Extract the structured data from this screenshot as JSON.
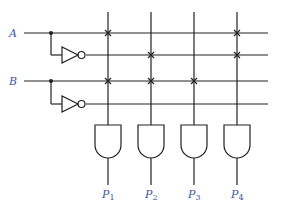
{
  "diagram": {
    "type": "PLA-style AND array",
    "inputs": [
      {
        "name": "A",
        "y": 33,
        "inv_y": 55
      },
      {
        "name": "B",
        "y": 81,
        "inv_y": 104
      }
    ],
    "rows": [
      {
        "id": "A",
        "y": 33,
        "crosses": [
          1,
          4
        ]
      },
      {
        "id": "A_not",
        "y": 55,
        "crosses": [
          2,
          4
        ]
      },
      {
        "id": "B",
        "y": 81,
        "crosses": [
          1,
          2,
          3
        ]
      },
      {
        "id": "B_not",
        "y": 104,
        "crosses": []
      }
    ],
    "columns_x": [
      108,
      151,
      194,
      237
    ],
    "outputs": [
      {
        "label": "P",
        "sub": "1"
      },
      {
        "label": "P",
        "sub": "2"
      },
      {
        "label": "P",
        "sub": "3"
      },
      {
        "label": "P",
        "sub": "4"
      }
    ],
    "colors": {
      "line": "#222222",
      "label": "#3a56a8"
    }
  }
}
